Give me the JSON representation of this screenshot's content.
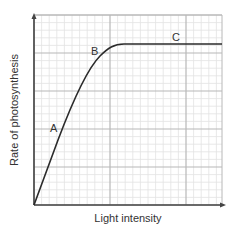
{
  "chart_data": {
    "type": "line",
    "title": "",
    "xlabel": "Light intensity",
    "ylabel": "Rate of photosynthesis",
    "grid": true,
    "legend": null,
    "x_ticks_labeled": false,
    "y_ticks_labeled": false,
    "xlim": [
      0,
      5
    ],
    "ylim": [
      0,
      5
    ],
    "series": [
      {
        "name": "Rate of photosynthesis",
        "points": [
          [
            0,
            0
          ],
          [
            0.5,
            1.2
          ],
          [
            0.75,
            1.95
          ],
          [
            1.0,
            2.75
          ],
          [
            1.25,
            3.6
          ],
          [
            1.5,
            4.2
          ],
          [
            1.75,
            4.55
          ],
          [
            2.25,
            4.75
          ],
          [
            3,
            4.75
          ],
          [
            4,
            4.75
          ],
          [
            5,
            4.75
          ]
        ]
      }
    ],
    "annotations": [
      {
        "label": "A",
        "x": 0.75,
        "y": 2.0
      },
      {
        "label": "B",
        "x": 1.6,
        "y": 4.0
      },
      {
        "label": "C",
        "x": 3.7,
        "y": 4.75
      }
    ]
  },
  "colors": {
    "curve": "#2b2b2b",
    "axis": "#444444",
    "grid_major": "#b8b8b8",
    "grid_minor": "#e2e2e2",
    "text": "#333333"
  }
}
